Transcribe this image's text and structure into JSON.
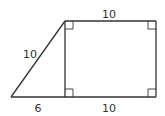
{
  "diagram": {
    "type": "geometry-figure",
    "colors": {
      "stroke": "#333333",
      "background": "#ffffff",
      "text": "#333333"
    },
    "vertices": {
      "left_apex": [
        11,
        97
      ],
      "top_left": [
        65,
        21
      ],
      "top_right": [
        156,
        21
      ],
      "bottom_right": [
        156,
        97
      ],
      "foot": [
        65,
        97
      ]
    },
    "labels": {
      "top": "10",
      "hypotenuse": "10",
      "bottom_left": "6",
      "bottom_right": "10"
    },
    "right_angle_markers": [
      "top-left",
      "top-right",
      "bottom-left-of-rectangle",
      "bottom-right"
    ]
  }
}
